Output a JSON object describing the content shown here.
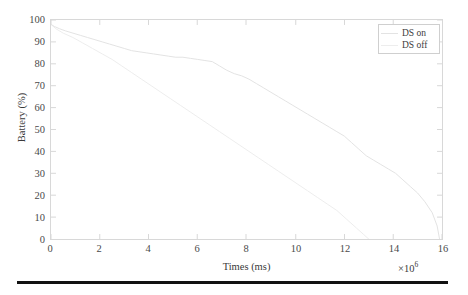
{
  "chart_data": {
    "type": "line",
    "title": "",
    "xlabel": "Times (ms)",
    "ylabel": "Battery (%)",
    "x_multiplier": "×10",
    "x_multiplier_exponent": "6",
    "xlim": [
      0,
      16
    ],
    "ylim": [
      0,
      100
    ],
    "xticks": [
      0,
      2,
      4,
      6,
      8,
      10,
      12,
      14,
      16
    ],
    "yticks": [
      0,
      10,
      20,
      30,
      40,
      50,
      60,
      70,
      80,
      90,
      100
    ],
    "grid": false,
    "legend_position": "upper right",
    "series": [
      {
        "name": "DS on",
        "color": "#e3e3e3",
        "x": [
          0.0,
          0.15,
          0.35,
          0.6,
          0.9,
          1.2,
          1.5,
          1.8,
          2.1,
          2.4,
          2.7,
          3.0,
          3.3,
          3.6,
          3.9,
          4.2,
          4.5,
          4.8,
          5.1,
          5.4,
          5.7,
          6.0,
          6.3,
          6.6,
          6.9,
          7.2,
          7.5,
          7.8,
          8.1,
          8.4,
          8.7,
          9.0,
          9.3,
          9.6,
          9.9,
          10.2,
          10.5,
          10.8,
          11.1,
          11.4,
          11.7,
          12.0,
          12.3,
          12.6,
          12.9,
          13.2,
          13.5,
          13.8,
          14.1,
          14.4,
          14.7,
          15.0,
          15.3,
          15.6,
          15.8,
          15.9
        ],
        "y": [
          98,
          97,
          96,
          95,
          94,
          93,
          92,
          91,
          90,
          89,
          88,
          87,
          86,
          85.5,
          85,
          84.5,
          84,
          83.5,
          83,
          83,
          82.5,
          82,
          81.5,
          81,
          79,
          77,
          75.5,
          74.5,
          73,
          71,
          69,
          67,
          65,
          63,
          61,
          59,
          57,
          55,
          53,
          51,
          49,
          47,
          44,
          41,
          38,
          36,
          34,
          32,
          30,
          27,
          24,
          21,
          17,
          12,
          6,
          0
        ]
      },
      {
        "name": "DS off",
        "color": "#ededed",
        "x": [
          0.0,
          0.2,
          0.5,
          0.9,
          1.3,
          1.7,
          2.1,
          2.5,
          2.9,
          3.3,
          3.7,
          4.1,
          4.5,
          4.9,
          5.3,
          5.7,
          6.1,
          6.5,
          6.9,
          7.3,
          7.7,
          8.1,
          8.5,
          8.9,
          9.3,
          9.7,
          10.1,
          10.5,
          10.9,
          11.3,
          11.7,
          12.1,
          12.5,
          12.8,
          13.0
        ],
        "y": [
          98,
          96,
          94,
          92,
          89.5,
          87,
          84.5,
          82,
          79,
          76,
          73,
          70,
          67,
          64,
          61,
          58,
          55,
          52,
          49,
          46,
          43,
          40,
          37,
          34,
          31,
          28,
          25,
          22,
          19,
          16,
          13,
          9,
          5,
          2,
          0
        ]
      }
    ]
  },
  "legend": {
    "entries": [
      {
        "label": "DS on"
      },
      {
        "label": "DS off"
      }
    ]
  },
  "colors": {
    "axis": "#d8d8d8",
    "text": "#3a3a3a",
    "rule": "#121212"
  }
}
